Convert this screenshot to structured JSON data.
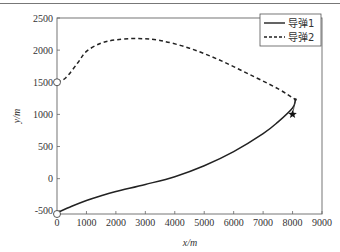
{
  "chart_data": {
    "type": "line",
    "title": "",
    "xlabel": "x/m",
    "ylabel": "y/m",
    "xlim": [
      0,
      9000
    ],
    "ylim": [
      -550,
      2500
    ],
    "xticks": [
      0,
      1000,
      2000,
      3000,
      4000,
      5000,
      6000,
      7000,
      8000,
      9000
    ],
    "xtick_labels": [
      "0",
      "1000",
      "2000",
      "3000",
      "4000",
      "5000",
      "6000",
      "7000",
      "8000",
      "9000"
    ],
    "yticks": [
      -500,
      0,
      500,
      1000,
      1500,
      2000,
      2500
    ],
    "ytick_labels": [
      "-500",
      "0",
      "500",
      "1000",
      "1500",
      "2000",
      "2500"
    ],
    "grid": false,
    "legend_position": "upper right",
    "series": [
      {
        "name": "导弹1",
        "style": "solid",
        "color": "#222222",
        "x": [
          0,
          500,
          1000,
          1500,
          2000,
          3000,
          4000,
          5000,
          6000,
          7000,
          7500,
          8000,
          8100
        ],
        "y": [
          -530,
          -430,
          -340,
          -265,
          -200,
          -90,
          30,
          200,
          420,
          700,
          880,
          1100,
          1230
        ]
      },
      {
        "name": "导弹2",
        "style": "dashed",
        "color": "#222222",
        "x": [
          0,
          300,
          700,
          1000,
          1500,
          2000,
          2700,
          3500,
          4500,
          5500,
          6500,
          7500,
          8100
        ],
        "y": [
          1500,
          1570,
          1800,
          1980,
          2110,
          2160,
          2180,
          2150,
          2030,
          1850,
          1630,
          1400,
          1230
        ]
      }
    ],
    "markers": [
      {
        "name": "start-missile-1",
        "shape": "open-circle",
        "x": 0,
        "y": -550
      },
      {
        "name": "start-missile-2",
        "shape": "open-circle",
        "x": 0,
        "y": 1500
      },
      {
        "name": "target",
        "shape": "star",
        "x": 8000,
        "y": 1000
      }
    ],
    "annotations": [
      {
        "type": "line",
        "from": [
          8100,
          1230
        ],
        "to": [
          8000,
          1000
        ]
      }
    ]
  },
  "legend": {
    "items": [
      {
        "label": "导弹1",
        "style": "solid"
      },
      {
        "label": "导弹2",
        "style": "dashed"
      }
    ]
  }
}
